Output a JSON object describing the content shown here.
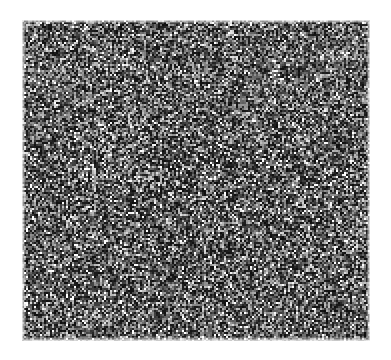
{
  "document": {
    "title": "Grayscale Random-Dot Noise Texture",
    "background_color": "#ffffff",
    "width": 391,
    "height": 360,
    "text_content": [],
    "visible_labels": [],
    "notes": "No text, axes, legends, buttons or UI chrome are rendered in the image."
  },
  "figure": {
    "name": "noise-texture",
    "type": "raster-noise-field",
    "x": 22,
    "y": 20,
    "width": 348,
    "height": 321,
    "grain_block_px": 2,
    "border": "none",
    "gray_levels": [
      "#ffffff",
      "#d9d9d9",
      "#b3b3b3",
      "#8c8c8c",
      "#666666",
      "#404040",
      "#1a1a1a"
    ],
    "palette": {
      "white": "#ffffff",
      "light_gray": "#c8c8c8",
      "mid_gray": "#909090",
      "dark_gray": "#555555",
      "near_black": "#222222"
    },
    "density": {
      "base_dark_fraction": 0.5,
      "description": "Uniform salt-and-pepper noise with smooth low-frequency luminance modulation"
    },
    "modulation_bands": [
      {
        "name": "top-light-band",
        "y_start": 0.0,
        "y_end": 0.3,
        "brightness_offset": 0.1
      },
      {
        "name": "upper-mid-band",
        "y_start": 0.3,
        "y_end": 0.4,
        "brightness_offset": 0.02
      },
      {
        "name": "central-dark-band",
        "y_start": 0.4,
        "y_end": 0.58,
        "brightness_offset": -0.12
      },
      {
        "name": "lower-mid-band",
        "y_start": 0.58,
        "y_end": 0.8,
        "brightness_offset": -0.02
      },
      {
        "name": "bottom-neutral-band",
        "y_start": 0.8,
        "y_end": 1.0,
        "brightness_offset": 0.03
      }
    ],
    "horizontal_modulation": [
      {
        "name": "left-edge",
        "x_start": 0.0,
        "x_end": 0.1,
        "brightness_offset": 0.06
      },
      {
        "name": "left-mid",
        "x_start": 0.1,
        "x_end": 0.38,
        "brightness_offset": -0.03
      },
      {
        "name": "center",
        "x_start": 0.38,
        "x_end": 0.62,
        "brightness_offset": -0.05
      },
      {
        "name": "right-mid",
        "x_start": 0.62,
        "x_end": 0.88,
        "brightness_offset": 0.02
      },
      {
        "name": "right-edge",
        "x_start": 0.88,
        "x_end": 1.0,
        "brightness_offset": 0.05
      }
    ],
    "highlight_clusters": [
      {
        "name": "bright-spot-upper-left-of-center",
        "cx": 0.3,
        "cy": 0.42,
        "radius": 0.035
      },
      {
        "name": "bright-spot-left-of-center",
        "cx": 0.28,
        "cy": 0.57,
        "radius": 0.03
      }
    ],
    "edge_fade": {
      "enabled": true,
      "top_px": 3,
      "bottom_px": 4,
      "left_px": 3,
      "right_px": 3
    },
    "random_seed": 20240517
  }
}
